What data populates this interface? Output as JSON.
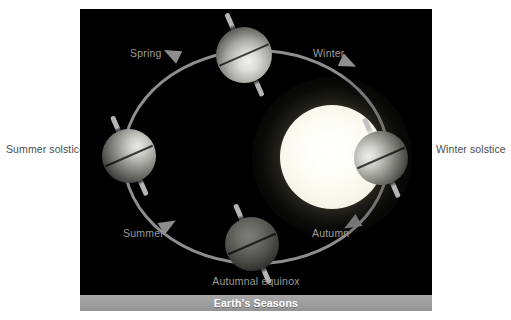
{
  "figure": {
    "caption": "Earth's Seasons",
    "background_color": "#ffffff",
    "panel_color": "#000000",
    "orbit_color": "#8e8e8e",
    "inner_label_color": "#9b9b9b",
    "outer_label_color": "#4d4d4d",
    "caption_bar_color": "#9e9e9e",
    "caption_text_color": "#ffffff"
  },
  "diagram": {
    "sun": {
      "name": "Sun",
      "core_color": "#ffffff",
      "glow_color": "#f3f2e2"
    },
    "orbit_labels": [
      {
        "id": "spring",
        "label": "Spring"
      },
      {
        "id": "winter",
        "label": "Winter"
      },
      {
        "id": "summer",
        "label": "Summer"
      },
      {
        "id": "autumn",
        "label": "Autumn"
      }
    ],
    "position_labels": [
      {
        "id": "summer-solstice",
        "label": "Summer solstice"
      },
      {
        "id": "winter-solstice",
        "label": "Winter solstice"
      },
      {
        "id": "autumnal-equinox",
        "label": "Autumnal equinox"
      }
    ],
    "earths": [
      {
        "id": "earth-top",
        "axial_tilt_deg": "23.5"
      },
      {
        "id": "earth-left",
        "axial_tilt_deg": "23.5"
      },
      {
        "id": "earth-right",
        "axial_tilt_deg": "23.5"
      },
      {
        "id": "earth-bottom",
        "axial_tilt_deg": "23.5"
      }
    ]
  }
}
